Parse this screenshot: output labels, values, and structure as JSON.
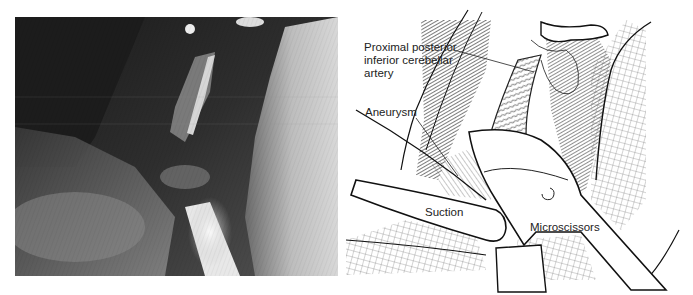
{
  "figure": {
    "left_panel": {
      "type": "intraoperative-photograph",
      "tone": "grayscale"
    },
    "right_panel": {
      "type": "line-illustration",
      "labels": {
        "pica_line1": "Proximal posterior",
        "pica_line2": "inferior cerebellar",
        "pica_line3": "artery",
        "aneurysm": "Aneurysm",
        "suction": "Suction",
        "microscissors": "Microscissors"
      }
    }
  }
}
